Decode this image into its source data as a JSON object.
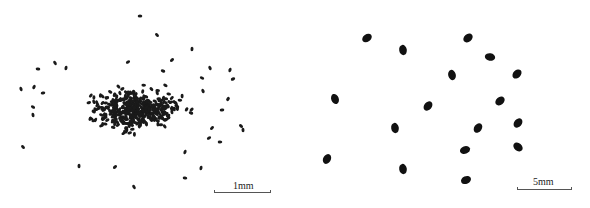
{
  "figure": {
    "panels": [
      {
        "id": "left",
        "description": "dense cluster of small dark seeds",
        "scale_bar": {
          "label": "1mm",
          "x1": 214,
          "x2": 271,
          "y": 193,
          "label_x": 233,
          "label_y": 181
        },
        "seed_color": "#1a1a1a",
        "cluster": {
          "cx": 135,
          "cy": 110,
          "rx": 70,
          "ry": 32,
          "count": 420,
          "rng_seed": 7
        },
        "outliers": [
          [
            140,
            16
          ],
          [
            157,
            35
          ],
          [
            192,
            49
          ],
          [
            172,
            60
          ],
          [
            38,
            69
          ],
          [
            55,
            63
          ],
          [
            66,
            68
          ],
          [
            128,
            62
          ],
          [
            163,
            71
          ],
          [
            210,
            68
          ],
          [
            230,
            70
          ],
          [
            233,
            79
          ],
          [
            202,
            78
          ],
          [
            21,
            89
          ],
          [
            34,
            87
          ],
          [
            43,
            93
          ],
          [
            33,
            107
          ],
          [
            33,
            115
          ],
          [
            228,
            99
          ],
          [
            222,
            110
          ],
          [
            241,
            126
          ],
          [
            243,
            130
          ],
          [
            212,
            128
          ],
          [
            220,
            142
          ],
          [
            23,
            147
          ],
          [
            79,
            166
          ],
          [
            115,
            167
          ],
          [
            185,
            178
          ],
          [
            134,
            187
          ],
          [
            201,
            168
          ],
          [
            209,
            138
          ],
          [
            191,
            113
          ],
          [
            203,
            91
          ],
          [
            185,
            152
          ]
        ]
      },
      {
        "id": "right",
        "description": "sparse larger dark seeds",
        "scale_bar": {
          "label": "5mm",
          "x1": 517,
          "x2": 572,
          "y": 190,
          "label_x": 533,
          "label_y": 177
        },
        "seed_color": "#111111",
        "seeds": [
          [
            367,
            38,
            -35
          ],
          [
            403,
            50,
            80
          ],
          [
            468,
            38,
            -40
          ],
          [
            490,
            57,
            10
          ],
          [
            452,
            75,
            75
          ],
          [
            517,
            74,
            -45
          ],
          [
            335,
            99,
            70
          ],
          [
            428,
            106,
            -50
          ],
          [
            500,
            101,
            -40
          ],
          [
            395,
            128,
            80
          ],
          [
            478,
            128,
            -55
          ],
          [
            518,
            123,
            -50
          ],
          [
            327,
            159,
            -60
          ],
          [
            403,
            169,
            80
          ],
          [
            465,
            150,
            -20
          ],
          [
            518,
            147,
            40
          ],
          [
            466,
            180,
            -25
          ]
        ]
      }
    ]
  }
}
